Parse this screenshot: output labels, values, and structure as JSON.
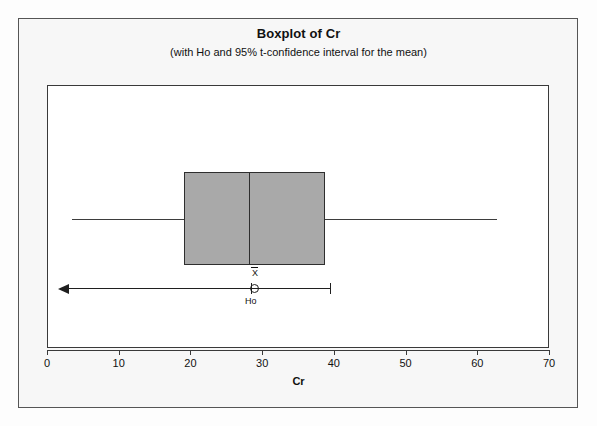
{
  "chart_data": {
    "type": "boxplot",
    "title": "Boxplot of Cr",
    "subtitle": "(with Ho and 95% t-confidence interval for the mean)",
    "xlabel": "Cr",
    "ylabel": "",
    "xlim": [
      0,
      70
    ],
    "xticks": [
      0,
      10,
      20,
      30,
      40,
      50,
      60,
      70
    ],
    "xtick_labels": [
      "0",
      "10",
      "20",
      "30",
      "40",
      "50",
      "60",
      "70"
    ],
    "grid": false,
    "legend": false,
    "orientation": "horizontal",
    "boxes": [
      {
        "name": "Cr",
        "whisker_low": 3.5,
        "q1": 19.1,
        "median": 28.1,
        "q3": 38.8,
        "whisker_high": 62.8,
        "mean": 29.0,
        "outliers": []
      }
    ],
    "annotations": {
      "mean_symbol": "X",
      "mean_symbol_has_overbar": true,
      "mean_value": 29.0,
      "ho_label": "Ho",
      "ho_value": 28.4,
      "ci_level": "95%",
      "ci_type": "one-sided (upper bound shown, arrow extends left)",
      "ci_upper": 39.4,
      "ci_arrow_direction": "left"
    },
    "colors": {
      "box_fill": "#a9a9a9",
      "box_border": "#2e2e2e",
      "whisker": "#3d3d3d",
      "annotation": "#1f1f1f",
      "panel_background": "#ffffff",
      "figure_background": "#f7f7f7",
      "frame_border": "#555555",
      "axis": "#3a3a3a",
      "text": "#111111"
    }
  },
  "figure": {
    "title": "Boxplot of Cr",
    "subtitle": "(with Ho and 95% t-confidence interval for the mean)",
    "axis_title": "Cr"
  },
  "axis": {
    "labels": [
      "0",
      "10",
      "20",
      "30",
      "40",
      "50",
      "60",
      "70"
    ]
  },
  "annotations": {
    "mean_symbol": "X",
    "ho_label": "Ho"
  }
}
